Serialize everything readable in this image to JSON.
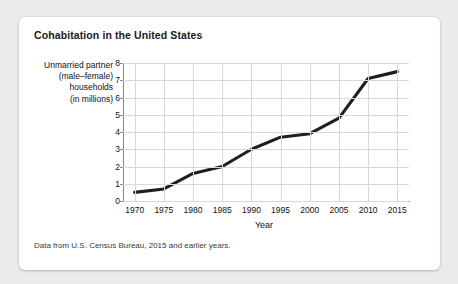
{
  "figure": {
    "title": "Cohabitation in the United States",
    "caption": "Data from U.S. Census Bureau, 2015 and earlier years."
  },
  "chart_data": {
    "type": "line",
    "title": "Cohabitation in the United States",
    "xlabel": "Year",
    "ylabel": "Unmarried partner (male–female) households (in millions)",
    "ylabel_lines": [
      "Unmarried partner",
      "(male–female)",
      "households",
      "(in millions)"
    ],
    "categories": [
      1970,
      1975,
      1980,
      1985,
      1990,
      1995,
      2000,
      2005,
      2010,
      2015
    ],
    "x": [
      1970,
      1975,
      1980,
      1985,
      1990,
      1995,
      2000,
      2005,
      2010,
      2015
    ],
    "values": [
      0.5,
      0.7,
      1.6,
      2.0,
      3.0,
      3.7,
      3.9,
      4.8,
      7.1,
      7.5
    ],
    "xtick_labels": [
      "1970",
      "1975",
      "1980",
      "1985",
      "1990",
      "1995",
      "2000",
      "2005",
      "2010",
      "2015"
    ],
    "ytick_labels": [
      "0",
      "1",
      "2",
      "3",
      "4",
      "5",
      "6",
      "7",
      "8"
    ],
    "yticks": [
      0,
      1,
      2,
      3,
      4,
      5,
      6,
      7,
      8
    ],
    "xlim": [
      1968,
      2017
    ],
    "ylim": [
      0,
      8
    ],
    "grid": true,
    "legend": false,
    "line_color": "#1f1f1f",
    "grid_color": "#d9d9d9",
    "axis_color": "#8a8a8a",
    "background": "#ffffff"
  }
}
